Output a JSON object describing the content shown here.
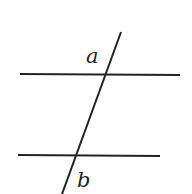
{
  "diagram": {
    "type": "parallel-lines-with-transversal",
    "labels": {
      "a": "a",
      "b": "b"
    },
    "colors": {
      "line": "#222222",
      "background": "#ffffff"
    },
    "lines": {
      "top": {
        "x1": 20,
        "y1": 74,
        "x2": 180,
        "y2": 75
      },
      "bottom": {
        "x1": 18,
        "y1": 155,
        "x2": 160,
        "y2": 156
      },
      "transversal": {
        "x1": 121,
        "y1": 32,
        "x2": 62,
        "y2": 194
      }
    }
  }
}
